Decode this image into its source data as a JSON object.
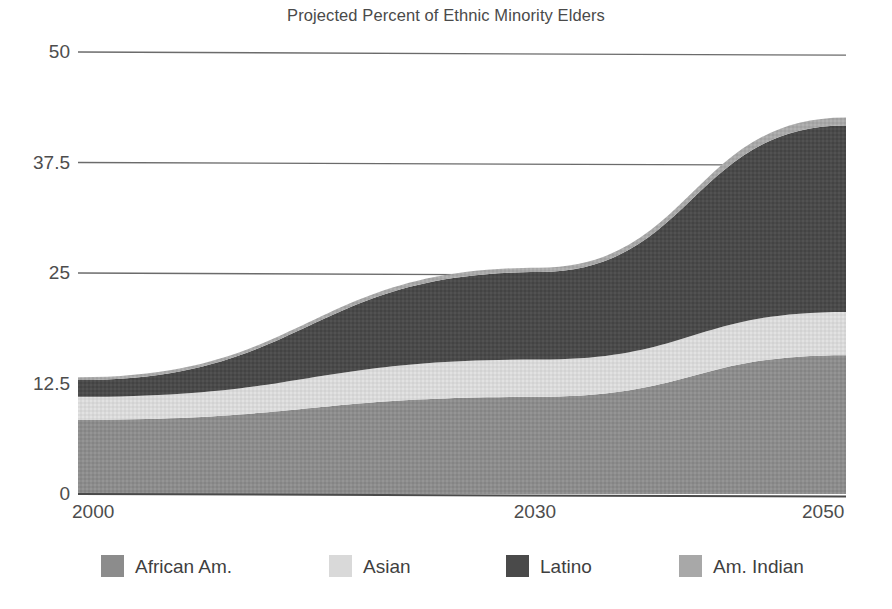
{
  "chart_data": {
    "type": "area",
    "title": "Projected Percent of Ethnic Minority Elders",
    "xlabel": "",
    "ylabel": "",
    "stacked": true,
    "grid": true,
    "legend_position": "bottom",
    "x": [
      2000,
      2030,
      2050
    ],
    "xlim": [
      2000,
      2050
    ],
    "ylim": [
      0,
      50
    ],
    "xticks": [
      "2000",
      "2030",
      "2050"
    ],
    "yticks": [
      "0",
      "12.5",
      "25",
      "37.5",
      "50"
    ],
    "ytick_values": [
      0,
      12.5,
      25,
      37.5,
      50
    ],
    "series": [
      {
        "name": "African Am.",
        "color": "#8c8c8c",
        "values": [
          8.4,
          11.0,
          15.7
        ]
      },
      {
        "name": "Asian",
        "color": "#d9d9d9",
        "values": [
          2.6,
          4.2,
          4.9
        ]
      },
      {
        "name": "Latino",
        "color": "#4a4a4a",
        "values": [
          1.9,
          9.9,
          21.1
        ]
      },
      {
        "name": "Am. Indian",
        "color": "#a8a8a8",
        "values": [
          0.3,
          0.5,
          0.9
        ]
      }
    ],
    "cumulative_tops": {
      "African Am.": [
        8.4,
        11.0,
        15.7
      ],
      "Asian": [
        11.0,
        15.2,
        20.6
      ],
      "Latino": [
        12.9,
        25.1,
        41.7
      ],
      "Am. Indian": [
        13.2,
        25.6,
        42.6
      ]
    },
    "colors": {
      "african_am": "#8c8c8c",
      "asian": "#d9d9d9",
      "latino": "#4a4a4a",
      "am_indian": "#a8a8a8",
      "gridline": "#6b6b6b",
      "text": "#4a4a4a",
      "background": "#ffffff"
    }
  },
  "title": "Projected Percent of Ethnic Minority Elders",
  "y_axis": {
    "ticks": [
      {
        "label": "50",
        "value": 50
      },
      {
        "label": "37.5",
        "value": 37.5
      },
      {
        "label": "25",
        "value": 25
      },
      {
        "label": "12.5",
        "value": 12.5
      },
      {
        "label": "0",
        "value": 0
      }
    ]
  },
  "x_axis": {
    "ticks": [
      {
        "label": "2000",
        "value": 2000
      },
      {
        "label": "2030",
        "value": 2030
      },
      {
        "label": "2050",
        "value": 2050
      }
    ]
  },
  "legend": {
    "items": [
      {
        "label": "African Am.",
        "color": "#8c8c8c"
      },
      {
        "label": "Asian",
        "color": "#d9d9d9"
      },
      {
        "label": "Latino",
        "color": "#4a4a4a"
      },
      {
        "label": "Am. Indian",
        "color": "#a8a8a8"
      }
    ]
  }
}
